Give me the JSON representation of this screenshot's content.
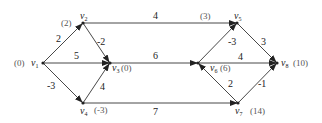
{
  "title": "",
  "nodes": [
    {
      "id": "v1",
      "name": "v",
      "sub": "1",
      "potential": "(0)",
      "x": 43,
      "y": 63
    },
    {
      "id": "v2",
      "name": "v",
      "sub": "2",
      "potential": "(2)",
      "x": 83,
      "y": 23
    },
    {
      "id": "v3",
      "name": "v",
      "sub": "3",
      "potential": "(0)",
      "x": 110,
      "y": 63
    },
    {
      "id": "v4",
      "name": "v",
      "sub": "4",
      "potential": "(-3)",
      "x": 83,
      "y": 103
    },
    {
      "id": "v5",
      "name": "v",
      "sub": "5",
      "potential": "(3)",
      "x": 237,
      "y": 23
    },
    {
      "id": "v6",
      "name": "v",
      "sub": "6",
      "potential": "(6)",
      "x": 198,
      "y": 63
    },
    {
      "id": "v7",
      "name": "v",
      "sub": "7",
      "potential": "(14)",
      "x": 238,
      "y": 103
    },
    {
      "id": "v8",
      "name": "v",
      "sub": "8",
      "potential": "(10)",
      "x": 277,
      "y": 63
    }
  ],
  "edges": [
    {
      "from": "v1",
      "to": "v2",
      "weight": "2"
    },
    {
      "from": "v1",
      "to": "v3",
      "weight": "5"
    },
    {
      "from": "v1",
      "to": "v4",
      "weight": "-3"
    },
    {
      "from": "v2",
      "to": "v3",
      "weight": "-2"
    },
    {
      "from": "v4",
      "to": "v3",
      "weight": "4"
    },
    {
      "from": "v2",
      "to": "v5",
      "weight": "4"
    },
    {
      "from": "v3",
      "to": "v6",
      "weight": "6"
    },
    {
      "from": "v4",
      "to": "v7",
      "weight": "7"
    },
    {
      "from": "v6",
      "to": "v5",
      "weight": "-3"
    },
    {
      "from": "v5",
      "to": "v8",
      "weight": "3"
    },
    {
      "from": "v6",
      "to": "v8",
      "weight": "4"
    },
    {
      "from": "v7",
      "to": "v6",
      "weight": "2"
    },
    {
      "from": "v7",
      "to": "v8",
      "weight": "-1"
    }
  ],
  "labels": {
    "w_v1_v2": "2",
    "w_v1_v3": "5",
    "w_v1_v4": "-3",
    "w_v2_v3": "-2",
    "w_v4_v3": "4",
    "w_v2_v5": "4",
    "w_v3_v6": "6",
    "w_v4_v7": "7",
    "w_v6_v5": "-3",
    "w_v5_v8": "3",
    "w_v6_v8": "4",
    "w_v7_v6": "2",
    "w_v7_v8": "-1",
    "p_v1": "(0)",
    "p_v2": "(2)",
    "p_v3": "(0)",
    "p_v4": "(-3)",
    "p_v5": "(3)",
    "p_v6": "(6)",
    "p_v7": "(14)",
    "p_v8": "(10)",
    "n": "v",
    "s1": "1",
    "s2": "2",
    "s3": "3",
    "s4": "4",
    "s5": "5",
    "s6": "6",
    "s7": "7",
    "s8": "8"
  },
  "colors": {
    "edge": "#333333",
    "text": "#222222",
    "potential": "#555555"
  }
}
